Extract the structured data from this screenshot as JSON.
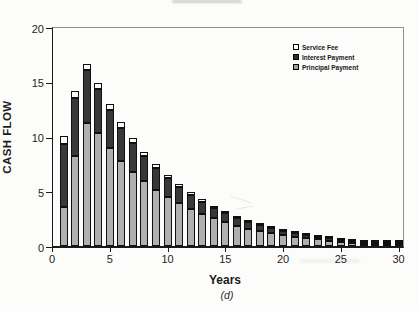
{
  "figure": {
    "caption": "(d)"
  },
  "chart_data": {
    "type": "bar",
    "stacked": true,
    "title": "",
    "xlabel": "Years",
    "ylabel": "CASH FLOW",
    "ylim": [
      0,
      20
    ],
    "xlim": [
      0,
      31
    ],
    "grid": false,
    "y_ticks": [
      0,
      5,
      10,
      15,
      20
    ],
    "x_ticks": [
      0,
      5,
      10,
      15,
      20,
      25,
      30
    ],
    "categories": [
      1,
      2,
      3,
      4,
      5,
      6,
      7,
      8,
      9,
      10,
      11,
      12,
      13,
      14,
      15,
      16,
      17,
      18,
      19,
      20,
      21,
      22,
      23,
      24,
      25,
      26,
      27,
      28,
      29,
      30
    ],
    "series": [
      {
        "name": "Principal Payment",
        "color": "#b0b0b0",
        "values": [
          3.6,
          8.2,
          11.2,
          10.3,
          8.95,
          7.75,
          6.75,
          5.9,
          5.15,
          4.5,
          3.9,
          3.4,
          2.95,
          2.55,
          2.2,
          1.9,
          1.65,
          1.45,
          1.25,
          1.1,
          0.95,
          0.82,
          0.72,
          0.62,
          0.54,
          0.47,
          0.4,
          0.35,
          0.28,
          0.24
        ]
      },
      {
        "name": "Interest Payment",
        "color": "#383838",
        "values": [
          5.75,
          5.35,
          4.85,
          4.0,
          3.5,
          3.05,
          2.7,
          2.3,
          2.0,
          1.72,
          1.47,
          1.28,
          1.1,
          0.95,
          0.82,
          0.7,
          0.62,
          0.52,
          0.46,
          0.38,
          0.34,
          0.28,
          0.24,
          0.21,
          0.18,
          0.16,
          0.13,
          0.12,
          0.09,
          0.08
        ]
      },
      {
        "name": "Service Fee",
        "color": "#fafafa",
        "values": [
          0.7,
          0.65,
          0.6,
          0.55,
          0.5,
          0.5,
          0.45,
          0.4,
          0.35,
          0.3,
          0.27,
          0.23,
          0.2,
          0.18,
          0.15,
          0.13,
          0.11,
          0.1,
          0.09,
          0.08,
          0.07,
          0.06,
          0.05,
          0.05,
          0.04,
          0.04,
          0.03,
          0.03,
          0.03,
          0.02
        ]
      }
    ],
    "legend": {
      "position": "upper-right",
      "entries": [
        {
          "label": "Service Fee",
          "color": "#ffffff"
        },
        {
          "label": "Interest Payment",
          "color": "#2d2d2d"
        },
        {
          "label": "Principal Payment",
          "color": "#9e9e9e"
        }
      ]
    }
  }
}
